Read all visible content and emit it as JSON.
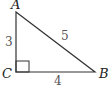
{
  "diagram": {
    "type": "right-triangle",
    "vertices": {
      "A": {
        "label": "A"
      },
      "B": {
        "label": "B"
      },
      "C": {
        "label": "C"
      }
    },
    "sides": {
      "AC": {
        "label": "3"
      },
      "CB": {
        "label": "4"
      },
      "AB": {
        "label": "5"
      }
    },
    "right_angle_at": "C",
    "colors": {
      "stroke": "#333333",
      "vertex_label": "#222222",
      "side_label": "#555555"
    }
  }
}
